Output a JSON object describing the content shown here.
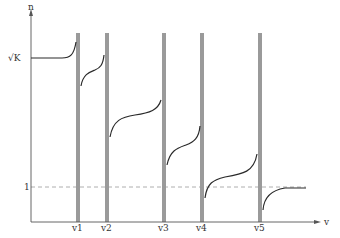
{
  "diagram": {
    "y_axis_label": "n",
    "x_axis_label": "v",
    "y_ticks": [
      {
        "label": "√K",
        "y": 58
      },
      {
        "label": "1",
        "y": 187
      }
    ],
    "resonances": [
      {
        "label": "v1",
        "x": 78
      },
      {
        "label": "v2",
        "x": 107
      },
      {
        "label": "v3",
        "x": 164
      },
      {
        "label": "v4",
        "x": 202
      },
      {
        "label": "v5",
        "x": 260
      }
    ],
    "colors": {
      "curve": "#2a2a2a",
      "bar": "#9a9a9a",
      "axis": "#555555",
      "dashed": "#999999"
    }
  }
}
